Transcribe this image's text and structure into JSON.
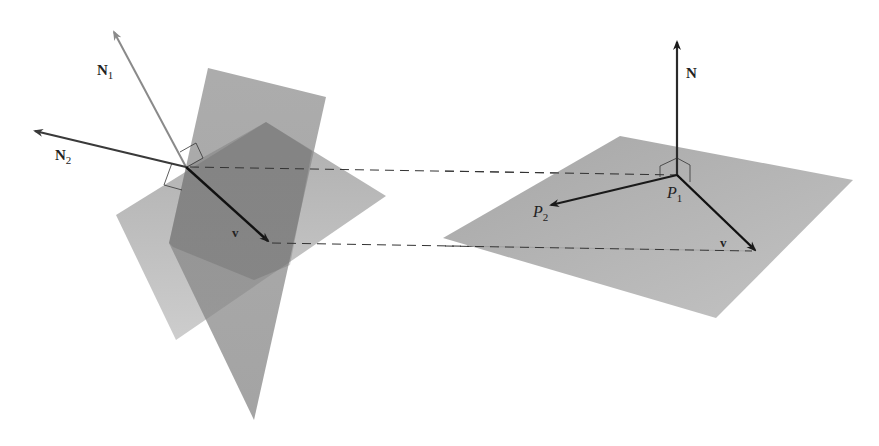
{
  "figure": {
    "left": {
      "planes": [
        {
          "name": "plane-1",
          "points": "116,215 266,122 386,196 176,340",
          "fill": "#9a9a9a",
          "opacity": 0.75
        },
        {
          "name": "plane-2",
          "points": "208,68 326,97 254,420 169,243",
          "fill": "#6e6e6e",
          "opacity": 0.75
        }
      ],
      "origin": [
        186,
        167
      ],
      "vectors": {
        "N1": {
          "tip": [
            113,
            30
          ],
          "color": "#8a8a8a",
          "label": "N",
          "sub": "1",
          "label_pos": [
            97,
            75
          ]
        },
        "N2": {
          "tip": [
            33,
            131
          ],
          "color": "#3a3a3a",
          "label": "N",
          "sub": "2",
          "label_pos": [
            55,
            160
          ]
        },
        "v": {
          "tip": [
            270,
            242
          ],
          "color": "#111111",
          "label": "v",
          "label_pos": [
            232,
            237
          ]
        }
      }
    },
    "right": {
      "plane": {
        "points": "443,238 620,136 853,180 716,318",
        "fill": "#a8a8a8"
      },
      "origin": [
        677,
        175
      ],
      "vectors": {
        "N": {
          "tip": [
            677,
            40
          ],
          "label": "N",
          "label_pos": [
            686,
            78
          ]
        },
        "P2": {
          "tip": [
            549,
            205
          ],
          "label": "P",
          "sub": "2",
          "label_pos": [
            533,
            217
          ]
        },
        "v": {
          "tip": [
            757,
            251
          ],
          "label": "v",
          "label_pos": [
            720,
            247
          ]
        }
      },
      "point_label": {
        "label": "P",
        "sub": "1",
        "label_pos": [
          667,
          198
        ]
      }
    },
    "dashed_lines": [
      {
        "from": [
          186,
          167
        ],
        "to": [
          677,
          175
        ]
      },
      {
        "from": [
          270,
          243
        ],
        "to": [
          757,
          251
        ]
      }
    ],
    "colors": {
      "dash": "#333333",
      "ink": "#1a1a1a",
      "rightangle": "#333333"
    }
  }
}
